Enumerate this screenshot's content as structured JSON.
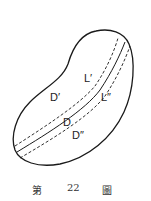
{
  "figure": {
    "labels": {
      "region_upper": "D′",
      "region_lower": "D″",
      "point_D": "D",
      "curve_upper": "L′",
      "curve_lower": "L″"
    },
    "caption": {
      "prefix": "第",
      "number": "22",
      "suffix": "圖"
    },
    "colors": {
      "stroke": "#1a1a1a",
      "background": "#ffffff"
    }
  }
}
